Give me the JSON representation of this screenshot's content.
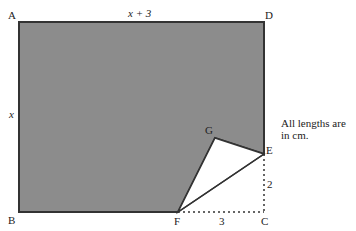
{
  "figure": {
    "points": {
      "A": {
        "label": "A",
        "x": 19,
        "y": 22
      },
      "D": {
        "label": "D",
        "x": 264,
        "y": 22
      },
      "B": {
        "label": "B",
        "x": 19,
        "y": 212
      },
      "F": {
        "label": "F",
        "x": 178,
        "y": 212
      },
      "C": {
        "label": "C",
        "x": 264,
        "y": 212
      },
      "E": {
        "label": "E",
        "x": 264,
        "y": 154
      },
      "G": {
        "label": "G",
        "x": 215,
        "y": 138
      }
    },
    "dimensions": {
      "top": "x + 3",
      "left": "x",
      "ec": "2",
      "fc": "3"
    },
    "note": "All lengths are in cm.",
    "colors": {
      "shaded": "#8c8c8c",
      "outline": "#333333",
      "triangle": "#ffffff"
    }
  }
}
